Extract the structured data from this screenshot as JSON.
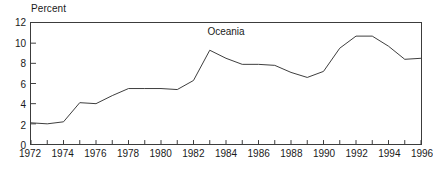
{
  "chart_data": {
    "type": "line",
    "title": "Oceania",
    "xlabel": "",
    "ylabel": "Percent",
    "ylabel_position": "above-axis",
    "grid": false,
    "legend": "none",
    "xlim": [
      1972,
      1996
    ],
    "ylim": [
      0,
      12
    ],
    "ytick_values": [
      0,
      2,
      4,
      6,
      8,
      10,
      12
    ],
    "ytick_labels": [
      "0",
      "2",
      "4",
      "6",
      "8",
      "10",
      "12"
    ],
    "xtick_values": [
      1972,
      1974,
      1976,
      1978,
      1980,
      1982,
      1984,
      1986,
      1988,
      1990,
      1992,
      1994,
      1996
    ],
    "xtick_labels": [
      "1972",
      "1974",
      "1976",
      "1978",
      "1980",
      "1982",
      "1984",
      "1986",
      "1988",
      "1990",
      "1992",
      "1994",
      "1996"
    ],
    "xminor_ticks_every": 1,
    "x": [
      1972,
      1973,
      1974,
      1975,
      1976,
      1977,
      1978,
      1979,
      1980,
      1981,
      1982,
      1983,
      1984,
      1985,
      1986,
      1987,
      1988,
      1989,
      1990,
      1991,
      1992,
      1993,
      1994,
      1995,
      1996
    ],
    "values": [
      2.1,
      2.0,
      2.2,
      4.1,
      4.0,
      4.8,
      5.5,
      5.5,
      5.5,
      5.4,
      6.3,
      9.3,
      8.5,
      7.9,
      7.9,
      7.8,
      7.1,
      6.6,
      7.2,
      9.5,
      10.7,
      10.7,
      9.7,
      8.4,
      8.5
    ],
    "series": [
      {
        "name": "Oceania",
        "values": [
          2.1,
          2.0,
          2.2,
          4.1,
          4.0,
          4.8,
          5.5,
          5.5,
          5.5,
          5.4,
          6.3,
          9.3,
          8.5,
          7.9,
          7.9,
          7.8,
          7.1,
          6.6,
          7.2,
          9.5,
          10.7,
          10.7,
          9.7,
          8.4,
          8.5
        ]
      }
    ],
    "line_color": "#3c3c3c",
    "frame_color": "#3c3c3c",
    "background_color": "#ffffff"
  }
}
